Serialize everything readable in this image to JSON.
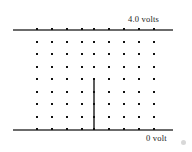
{
  "figure": {
    "background_color": "#ffffff"
  },
  "top_plate": {
    "label": "4.0  volts",
    "voltage_value": 4.0,
    "voltage_unit": "volts",
    "color": "#6b6b6b",
    "x_start": 13,
    "x_end": 173,
    "y": 29
  },
  "bottom_plate": {
    "label": "0 volt",
    "voltage_value": 0,
    "voltage_unit": "volt",
    "color": "#6b6b6b",
    "x_start": 13,
    "x_end": 173,
    "y": 129
  },
  "barrier": {
    "name": "center-vertical-conductor",
    "color": "#5d5d5d",
    "x": 93,
    "y_top": 78,
    "y_bottom": 130
  },
  "dot_grid": {
    "rows": 9,
    "columns": 9,
    "dot_color": "#111111",
    "dot_size": 2.2,
    "x_start": 37,
    "x_step": 15,
    "y_start": 29,
    "y_step": 12.5,
    "column_x": [
      37,
      52,
      67,
      82,
      94,
      109,
      124,
      139,
      154
    ],
    "row_y": [
      29,
      42,
      54,
      67,
      79,
      92,
      104,
      117,
      129
    ]
  },
  "corner_mark": {
    "name": "resize-handle-artifact",
    "color": "#d8d8d8"
  }
}
